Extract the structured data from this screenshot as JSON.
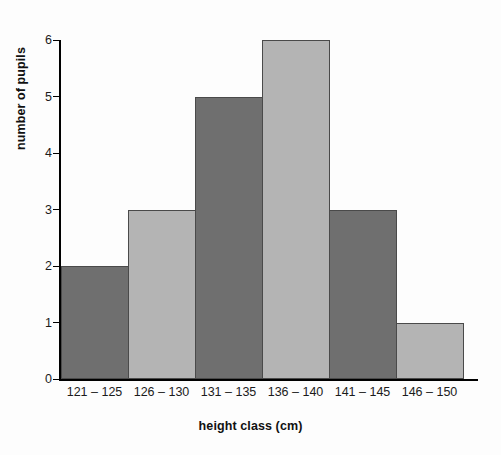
{
  "chart_data": {
    "type": "bar",
    "title": "",
    "subtitle": "",
    "xlabel": "height class (cm)",
    "ylabel": "number of pupils",
    "categories": [
      "121 – 125",
      "126 – 130",
      "131 – 135",
      "136 – 140",
      "141 – 145",
      "146 – 150"
    ],
    "values": [
      2,
      3,
      5,
      6,
      3,
      1
    ],
    "ylim": [
      0,
      6
    ],
    "y_ticks": [
      0,
      1,
      2,
      3,
      4,
      5,
      6
    ],
    "y_tick_labels": [
      "0",
      "1",
      "2",
      "3",
      "4",
      "5",
      "6"
    ],
    "grid": false,
    "legend": null,
    "bar_colors": [
      "#6f6f6f",
      "#b4b4b4",
      "#6f6f6f",
      "#b4b4b4",
      "#6f6f6f",
      "#b4b4b4"
    ],
    "bar_outline_color": "#4a4a4a",
    "axis_color": "#000000",
    "background_color": "#fdfdfd",
    "annotations": []
  }
}
